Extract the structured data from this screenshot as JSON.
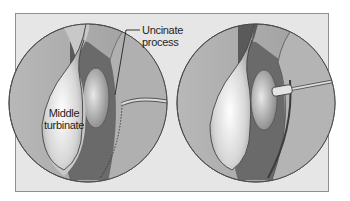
{
  "figure": {
    "panels": [
      {
        "name": "left-panel",
        "description": "Endoscopic view before uncinate process incision"
      },
      {
        "name": "right-panel",
        "description": "Endoscopic view with instrument at uncinate process"
      }
    ],
    "labels": {
      "uncinate_line1": "Uncinate",
      "uncinate_line2": "process",
      "middle_line1": "Middle",
      "middle_line2": "turbinate"
    },
    "colors": {
      "background": "#e6e6e6",
      "frame_border": "#8f8f8f",
      "circle_fill": "#a9a9a9",
      "turbinate_light": "#f2f2f2",
      "dark_shadow": "#5e5e5e"
    }
  }
}
